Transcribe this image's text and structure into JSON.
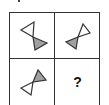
{
  "puzzle": {
    "cells": [
      {
        "position": "top-left",
        "figure": "bowtie",
        "rotation_deg": 0,
        "filled_triangle": "bottom-right"
      },
      {
        "position": "top-right",
        "figure": "bowtie",
        "rotation_deg": 90,
        "filled_triangle": "bottom-left"
      },
      {
        "position": "bottom-left",
        "figure": "bowtie",
        "rotation_deg": 180,
        "filled_triangle": "top-right"
      },
      {
        "position": "bottom-right",
        "figure": "unknown",
        "label": "?"
      }
    ],
    "colors": {
      "outline": "#333333",
      "fill": "#a0a0a0",
      "background": "#ffffff"
    }
  }
}
